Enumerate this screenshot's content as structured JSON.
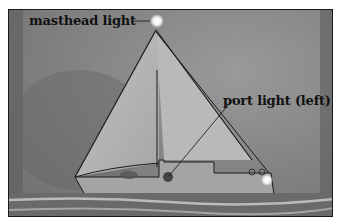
{
  "illustration": {
    "subject": "sailboat at night",
    "labels": {
      "masthead": "masthead light",
      "port": "port light (left)"
    },
    "colors": {
      "sky": "#858585",
      "sail": "#b4b4b4",
      "hull": "#a8a8a8",
      "water": "#6a6a6a",
      "light_glow": "#ffffff",
      "outline": "#1a1a1a"
    }
  }
}
